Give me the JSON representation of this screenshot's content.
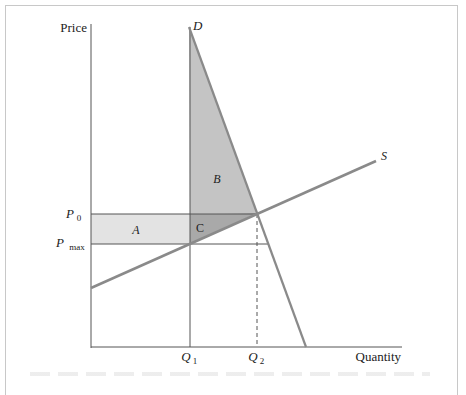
{
  "diagram": {
    "axes": {
      "y_label": "Price",
      "x_label": "Quantity"
    },
    "curves": {
      "demand_label": "D",
      "supply_label": "S"
    },
    "price_labels": {
      "p0": "P",
      "p0_sub": "0",
      "pmax": "P",
      "pmax_sub": "max"
    },
    "quantity_labels": {
      "q1": "Q",
      "q1_sub": "1",
      "q2": "Q",
      "q2_sub": "2"
    },
    "regions": {
      "a": "A",
      "b": "B",
      "c": "C"
    },
    "colors": {
      "curve": "#8a8a8a",
      "axis": "#555555",
      "region_a": "#e3e3e3",
      "region_b": "#c4c4c4",
      "region_c": "#a9a9a9",
      "frame": "#c8c8c8"
    }
  }
}
